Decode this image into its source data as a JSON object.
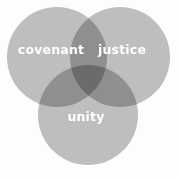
{
  "diagram": {
    "type": "venn-3-set",
    "width": 179,
    "height": 180,
    "background_color": "#fdfdfd",
    "circle_fill_color": "#c0c0c0",
    "two_set_overlap_color": "#929292",
    "three_set_overlap_color": "#5a5a5a",
    "label_color": "#ffffff",
    "sets": [
      {
        "id": "covenant",
        "label": "covenant",
        "cx": 57,
        "cy": 57,
        "r": 50,
        "label_x": 51,
        "label_y": 50
      },
      {
        "id": "justice",
        "label": "justice",
        "cx": 120,
        "cy": 57,
        "r": 50,
        "label_x": 122,
        "label_y": 50
      },
      {
        "id": "unity",
        "label": "unity",
        "cx": 88,
        "cy": 115,
        "r": 50,
        "label_x": 86,
        "label_y": 117
      }
    ]
  }
}
